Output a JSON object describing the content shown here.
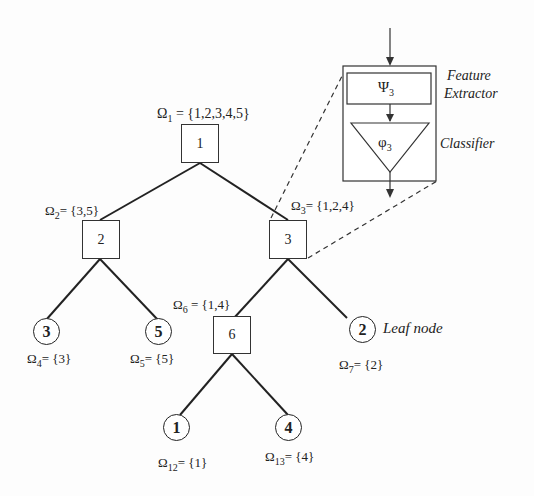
{
  "diagram": {
    "nodes": [
      {
        "id": "1",
        "type": "internal",
        "label": "1",
        "set_symbol": "Ω",
        "set_index": "1",
        "set": "{1,2,3,4,5}"
      },
      {
        "id": "2",
        "type": "internal",
        "label": "2",
        "set_symbol": "Ω",
        "set_index": "2",
        "set": "{3,5}"
      },
      {
        "id": "3",
        "type": "internal",
        "label": "3",
        "set_symbol": "Ω",
        "set_index": "3",
        "set": "{1,2,4}"
      },
      {
        "id": "6",
        "type": "internal",
        "label": "6",
        "set_symbol": "Ω",
        "set_index": "6",
        "set": "{1,4}"
      },
      {
        "id": "4",
        "type": "leaf",
        "label": "3",
        "set_symbol": "Ω",
        "set_index": "4",
        "set": "{3}"
      },
      {
        "id": "5",
        "type": "leaf",
        "label": "5",
        "set_symbol": "Ω",
        "set_index": "5",
        "set": "{5}"
      },
      {
        "id": "7",
        "type": "leaf",
        "label": "2",
        "set_symbol": "Ω",
        "set_index": "7",
        "set": "{2}"
      },
      {
        "id": "12",
        "type": "leaf",
        "label": "1",
        "set_symbol": "Ω",
        "set_index": "12",
        "set": "{1}"
      },
      {
        "id": "13",
        "type": "leaf",
        "label": "4",
        "set_symbol": "Ω",
        "set_index": "13",
        "set": "{4}"
      }
    ],
    "edges": [
      [
        "1",
        "2"
      ],
      [
        "1",
        "3"
      ],
      [
        "2",
        "4"
      ],
      [
        "2",
        "5"
      ],
      [
        "3",
        "6"
      ],
      [
        "3",
        "7"
      ],
      [
        "6",
        "12"
      ],
      [
        "6",
        "13"
      ]
    ],
    "leaf_annotation": "Leaf node",
    "detail": {
      "feature_extractor_symbol": "Ψ",
      "feature_extractor_index": "3",
      "feature_extractor_label_1": "Feature",
      "feature_extractor_label_2": "Extractor",
      "classifier_symbol": "φ",
      "classifier_index": "3",
      "classifier_label": "Classifier"
    }
  }
}
